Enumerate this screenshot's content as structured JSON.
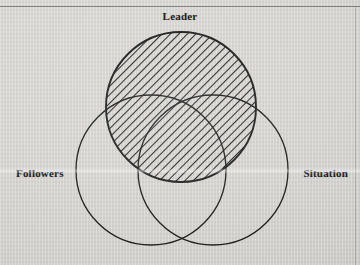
{
  "figure": {
    "type": "venn-diagram",
    "circle_count": 3,
    "shaded_set": "Leader",
    "shading_style": "diagonal-hatch",
    "labels": {
      "top": "Leader",
      "left": "Followers",
      "right": "Situation"
    },
    "colors": {
      "background": "#d3d2ce",
      "stroke": "#1a1a1a",
      "hatch": "#1a1a1a",
      "text": "#17171a",
      "rule": "#6f6f6d"
    },
    "geometry": {
      "leader": {
        "cx": 181,
        "cy": 107,
        "r": 75
      },
      "followers": {
        "cx": 151,
        "cy": 170,
        "r": 75
      },
      "situation": {
        "cx": 213,
        "cy": 170,
        "r": 75
      }
    }
  }
}
